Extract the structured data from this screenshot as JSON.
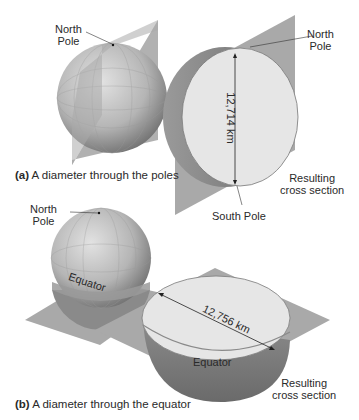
{
  "panel_a": {
    "caption_letter": "(a)",
    "caption_text": " A diameter through the poles",
    "north_pole_left": [
      "North",
      "Pole"
    ],
    "north_pole_right": [
      "North",
      "Pole"
    ],
    "south_pole": "South Pole",
    "diameter": "12,714 km",
    "result": [
      "Resulting",
      "cross section"
    ]
  },
  "panel_b": {
    "caption_letter": "(b)",
    "caption_text": " A diameter through the equator",
    "north_pole": [
      "North",
      "Pole"
    ],
    "equator_globe": "Equator",
    "equator_section": "Equator",
    "diameter": "12,756 km",
    "result": [
      "Resulting",
      "cross section"
    ]
  },
  "colors": {
    "plane": "#a9a9a9",
    "section_face": "#e6e6e6",
    "globe_light": "#d8d8d8",
    "globe_dark": "#7a7a7a"
  }
}
